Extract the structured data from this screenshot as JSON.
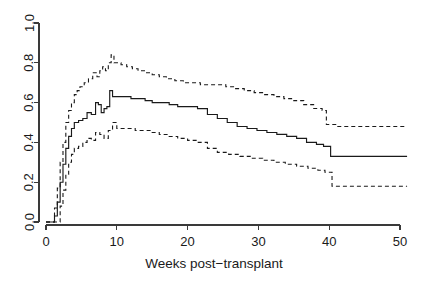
{
  "chart_data": {
    "type": "line",
    "title": "",
    "subtitle": "",
    "xlabel": "Weeks post−transplant",
    "ylabel": "",
    "xlim": [
      0,
      52
    ],
    "ylim": [
      0,
      1.0
    ],
    "x_ticks": [
      0,
      10,
      20,
      30,
      40,
      50
    ],
    "x_tick_labels": [
      "0",
      "10",
      "20",
      "30",
      "40",
      "50"
    ],
    "y_ticks": [
      0.0,
      0.2,
      0.4,
      0.6,
      0.8,
      1.0
    ],
    "y_tick_labels": [
      "0.0",
      "0.2",
      "0.4",
      "0.6",
      "0.8",
      "1.0"
    ],
    "grid": false,
    "legend": false,
    "legend_position": "none",
    "style": "step",
    "line_color": "#1a1a1a",
    "axis_color": "#3a3a3a",
    "background": "#ffffff",
    "series": [
      {
        "name": "Upper 95% confidence limit",
        "linestyle": "dashed",
        "x": [
          0,
          0.8,
          1.2,
          1.6,
          2.0,
          2.4,
          2.8,
          3.2,
          3.6,
          4.0,
          4.4,
          4.8,
          5.4,
          6.0,
          6.6,
          7.2,
          7.6,
          8.0,
          8.4,
          8.8,
          9.2,
          9.6,
          10.0,
          10.6,
          11.4,
          12.2,
          13.0,
          14.0,
          15.0,
          16.0,
          17.0,
          18.2,
          19.4,
          20.6,
          21.8,
          23.0,
          24.2,
          25.4,
          26.6,
          28.0,
          29.4,
          30.8,
          32.2,
          33.6,
          35.0,
          36.4,
          37.8,
          39.0,
          39.6,
          41.0,
          43.0,
          45.0,
          47.0,
          49.0,
          51.0
        ],
        "y": [
          0.0,
          0.0,
          0.07,
          0.17,
          0.3,
          0.4,
          0.5,
          0.56,
          0.6,
          0.64,
          0.66,
          0.68,
          0.7,
          0.72,
          0.75,
          0.73,
          0.76,
          0.78,
          0.76,
          0.8,
          0.84,
          0.8,
          0.8,
          0.79,
          0.78,
          0.77,
          0.76,
          0.75,
          0.74,
          0.73,
          0.72,
          0.71,
          0.7,
          0.7,
          0.69,
          0.69,
          0.69,
          0.68,
          0.67,
          0.66,
          0.65,
          0.64,
          0.63,
          0.62,
          0.61,
          0.59,
          0.57,
          0.56,
          0.49,
          0.48,
          0.48,
          0.48,
          0.48,
          0.48,
          0.48
        ]
      },
      {
        "name": "Estimated cumulative incidence",
        "linestyle": "solid",
        "x": [
          0,
          0.8,
          1.2,
          1.6,
          2.0,
          2.4,
          2.8,
          3.2,
          3.6,
          4.0,
          4.6,
          5.2,
          5.8,
          6.4,
          7.0,
          7.4,
          7.8,
          8.2,
          8.6,
          9.0,
          9.4,
          9.8,
          10.4,
          11.2,
          12.0,
          13.0,
          14.0,
          15.0,
          16.2,
          17.4,
          18.6,
          20.0,
          21.4,
          22.8,
          24.2,
          25.6,
          27.0,
          28.4,
          29.8,
          31.2,
          32.6,
          34.0,
          35.4,
          36.8,
          38.2,
          39.2,
          40.2,
          41.6,
          43.0,
          45.0,
          47.0,
          49.0,
          51.0
        ],
        "y": [
          0.0,
          0.0,
          0.03,
          0.1,
          0.2,
          0.29,
          0.37,
          0.43,
          0.47,
          0.5,
          0.51,
          0.52,
          0.55,
          0.54,
          0.6,
          0.59,
          0.55,
          0.57,
          0.58,
          0.66,
          0.63,
          0.63,
          0.63,
          0.63,
          0.62,
          0.62,
          0.61,
          0.6,
          0.6,
          0.59,
          0.58,
          0.58,
          0.57,
          0.54,
          0.52,
          0.5,
          0.48,
          0.47,
          0.46,
          0.45,
          0.44,
          0.43,
          0.42,
          0.4,
          0.39,
          0.38,
          0.33,
          0.33,
          0.33,
          0.33,
          0.33,
          0.33,
          0.33
        ]
      },
      {
        "name": "Lower 95% confidence limit",
        "linestyle": "dashed",
        "x": [
          0,
          1.0,
          1.6,
          2.0,
          2.4,
          2.8,
          3.2,
          3.6,
          4.0,
          4.6,
          5.2,
          5.8,
          6.4,
          7.0,
          7.6,
          8.2,
          8.8,
          9.4,
          10.0,
          10.8,
          11.6,
          12.6,
          13.6,
          14.8,
          16.0,
          17.2,
          18.6,
          20.0,
          21.4,
          22.8,
          24.2,
          25.8,
          27.4,
          29.0,
          30.6,
          32.2,
          33.8,
          35.4,
          37.0,
          38.4,
          39.4,
          40.4,
          42.0,
          44.0,
          46.0,
          48.0,
          50.0,
          51.0
        ],
        "y": [
          0.0,
          0.0,
          0.0,
          0.08,
          0.16,
          0.24,
          0.3,
          0.34,
          0.37,
          0.38,
          0.4,
          0.42,
          0.41,
          0.45,
          0.44,
          0.42,
          0.46,
          0.5,
          0.47,
          0.47,
          0.47,
          0.46,
          0.46,
          0.45,
          0.44,
          0.43,
          0.42,
          0.41,
          0.4,
          0.37,
          0.35,
          0.34,
          0.33,
          0.32,
          0.31,
          0.3,
          0.29,
          0.28,
          0.27,
          0.26,
          0.25,
          0.18,
          0.18,
          0.18,
          0.18,
          0.18,
          0.18,
          0.18
        ]
      }
    ]
  }
}
